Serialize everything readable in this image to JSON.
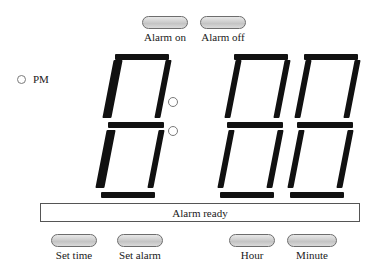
{
  "device": {
    "name": "Digital alarm clock face"
  },
  "top_buttons": [
    {
      "id": "alarm-on",
      "label": "Alarm on"
    },
    {
      "id": "alarm-off",
      "label": "Alarm off"
    }
  ],
  "indicator": {
    "label": "PM",
    "lit": false
  },
  "display": {
    "value": "18:88",
    "digits": [
      "1",
      "8",
      "8",
      "8"
    ],
    "separator": "colon",
    "segments": [
      {
        "digit": "1",
        "a": false,
        "b": true,
        "c": true,
        "d": false,
        "e": false,
        "f": false,
        "g": false
      },
      {
        "digit": "8",
        "a": true,
        "b": true,
        "c": true,
        "d": true,
        "e": true,
        "f": true,
        "g": true
      },
      {
        "digit": "8",
        "a": true,
        "b": true,
        "c": true,
        "d": true,
        "e": true,
        "f": true,
        "g": true
      },
      {
        "digit": "8",
        "a": true,
        "b": true,
        "c": true,
        "d": true,
        "e": true,
        "f": true,
        "g": true
      }
    ],
    "segment_color": "#111111",
    "background_color": "#ffffff"
  },
  "status": {
    "text": "Alarm ready"
  },
  "bottom_buttons": [
    {
      "id": "set-time",
      "label": "Set time"
    },
    {
      "id": "set-alarm",
      "label": "Set alarm"
    },
    {
      "id": "hour",
      "label": "Hour"
    },
    {
      "id": "minute",
      "label": "Minute"
    }
  ],
  "colors": {
    "button_face": "#d2d2d2",
    "button_outline": "#6d6d6d",
    "strip_outline": "#555555",
    "text": "#1a1a1a"
  }
}
